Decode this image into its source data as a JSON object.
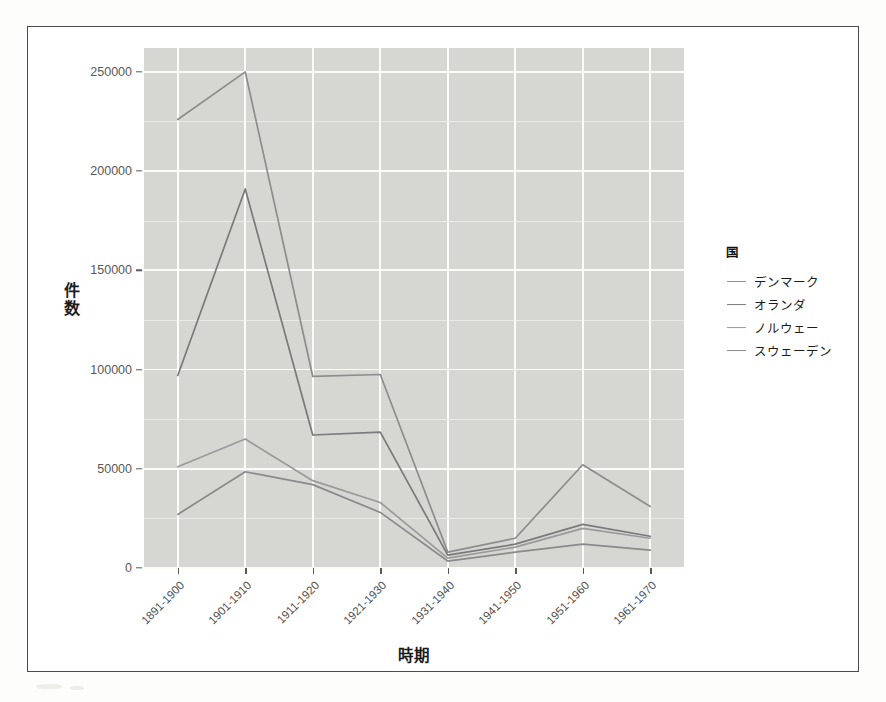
{
  "chart_data": {
    "type": "line",
    "title": "",
    "xlabel": "時期",
    "ylabel": "件数",
    "categories": [
      "1891-1900",
      "1901-1910",
      "1911-1920",
      "1921-1930",
      "1931-1940",
      "1941-1950",
      "1951-1960",
      "1961-1970"
    ],
    "ylim": [
      0,
      262000
    ],
    "yticks": [
      0,
      50000,
      100000,
      150000,
      200000,
      250000
    ],
    "ytick_labels": [
      "0",
      "50000",
      "100000",
      "150000",
      "200000",
      "250000"
    ],
    "grid": true,
    "legend_position": "right",
    "legend_title": "国",
    "series": [
      {
        "name": "デンマーク",
        "color": "#8d8d8d",
        "values": [
          226000,
          250000,
          96500,
          97500,
          8000,
          15000,
          52000,
          31000
        ]
      },
      {
        "name": "オランダ",
        "color": "#7a7a7a",
        "values": [
          97000,
          191000,
          67000,
          68500,
          6500,
          12000,
          22000,
          16000
        ]
      },
      {
        "name": "ノルウェー",
        "color": "#9a9a9a",
        "values": [
          51000,
          65000,
          44000,
          33000,
          5000,
          10500,
          20000,
          15000
        ]
      },
      {
        "name": "スウェーデン",
        "color": "#8a8a8a",
        "values": [
          27000,
          48500,
          42000,
          28000,
          3500,
          8000,
          12000,
          9000
        ]
      }
    ]
  },
  "axes": {
    "y_title_chars": [
      "件",
      "数"
    ],
    "x_title": "時期"
  },
  "legend": {
    "title": "国",
    "items": [
      {
        "label": "デンマーク",
        "color": "#8d8d8d"
      },
      {
        "label": "オランダ",
        "color": "#7a7a7a"
      },
      {
        "label": "ノルウェー",
        "color": "#9a9a9a"
      },
      {
        "label": "スウェーデン",
        "color": "#8a8a8a"
      }
    ]
  },
  "panel": {
    "background": "#d6d6d3",
    "gridline_major": "#fbfbfa",
    "gridline_minor": "#e9e9e6"
  }
}
